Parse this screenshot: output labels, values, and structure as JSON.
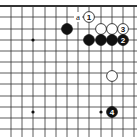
{
  "diagram": {
    "type": "go-board-fragment",
    "grid": {
      "cols_x": [
        11,
        22,
        33,
        45,
        56,
        67,
        78,
        89,
        101,
        112,
        123,
        134
      ],
      "rows_y": [
        6,
        17,
        29,
        40,
        51,
        62,
        73,
        84,
        96,
        107,
        118,
        129
      ],
      "top_edge": true
    },
    "star_points": [
      {
        "x": 33,
        "y": 40
      },
      {
        "x": 33,
        "y": 112
      },
      {
        "x": 101,
        "y": 112
      }
    ],
    "stones": [
      {
        "color": "black",
        "x": 67,
        "y": 29,
        "label": ""
      },
      {
        "color": "white",
        "x": 89,
        "y": 17,
        "label": "1"
      },
      {
        "color": "white",
        "x": 101,
        "y": 29,
        "label": ""
      },
      {
        "color": "white",
        "x": 112,
        "y": 29,
        "label": ""
      },
      {
        "color": "white",
        "x": 123,
        "y": 29,
        "label": "3"
      },
      {
        "color": "black",
        "x": 89,
        "y": 40,
        "label": ""
      },
      {
        "color": "black",
        "x": 101,
        "y": 40,
        "label": ""
      },
      {
        "color": "black",
        "x": 112,
        "y": 40,
        "label": ""
      },
      {
        "color": "black",
        "x": 123,
        "y": 40,
        "label": "2"
      },
      {
        "color": "white",
        "x": 112,
        "y": 76,
        "label": ""
      },
      {
        "color": "black",
        "x": 112,
        "y": 112,
        "label": "4"
      }
    ],
    "markers": [
      {
        "text": "a",
        "x": 78,
        "y": 17
      }
    ]
  }
}
